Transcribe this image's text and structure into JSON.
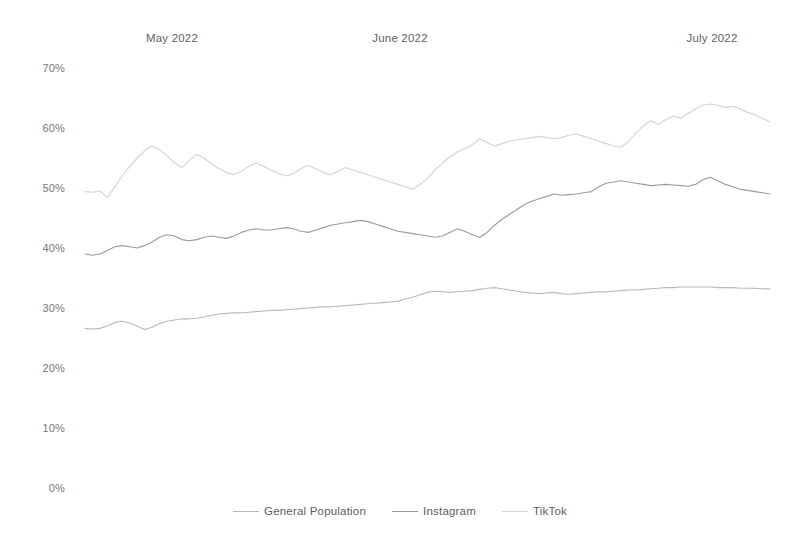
{
  "chart_data": {
    "type": "line",
    "title": "",
    "subtitle": "",
    "xlabel": "",
    "ylabel": "",
    "ylim": [
      0,
      70
    ],
    "ytick_labels": [
      "0%",
      "10%",
      "20%",
      "30%",
      "40%",
      "50%",
      "60%",
      "70%"
    ],
    "ytick_values": [
      0,
      10,
      20,
      30,
      40,
      50,
      60,
      70
    ],
    "xtick_labels": [
      "May 2022",
      "June 2022",
      "July 2022"
    ],
    "xtick_positions": [
      13,
      44,
      74
    ],
    "x_range": [
      0,
      92
    ],
    "grid": false,
    "legend_position": "bottom-center",
    "series": [
      {
        "name": "General Population",
        "color": "#b9b9b9",
        "values": [
          26.6,
          26.5,
          26.6,
          27.0,
          27.6,
          27.8,
          27.5,
          27.0,
          26.4,
          26.8,
          27.4,
          27.8,
          28.0,
          28.2,
          28.2,
          28.3,
          28.5,
          28.8,
          29.0,
          29.1,
          29.2,
          29.2,
          29.3,
          29.4,
          29.5,
          29.6,
          29.6,
          29.7,
          29.8,
          29.9,
          30.0,
          30.1,
          30.2,
          30.2,
          30.3,
          30.4,
          30.5,
          30.6,
          30.7,
          30.8,
          30.9,
          31.0,
          31.1,
          31.5,
          31.8,
          32.2,
          32.6,
          32.8,
          32.7,
          32.6,
          32.7,
          32.8,
          32.9,
          33.1,
          33.3,
          33.4,
          33.2,
          33.0,
          32.8,
          32.6,
          32.5,
          32.4,
          32.5,
          32.6,
          32.4,
          32.3,
          32.4,
          32.5,
          32.6,
          32.7,
          32.7,
          32.8,
          32.9,
          33.0,
          33.0,
          33.1,
          33.2,
          33.3,
          33.4,
          33.4,
          33.5,
          33.5,
          33.5,
          33.5,
          33.5,
          33.4,
          33.4,
          33.4,
          33.3,
          33.3,
          33.3,
          33.2,
          33.2
        ]
      },
      {
        "name": "Instagram",
        "color": "#9b9b9b",
        "values": [
          39.0,
          38.8,
          39.0,
          39.6,
          40.2,
          40.4,
          40.2,
          40.0,
          40.4,
          41.0,
          41.8,
          42.2,
          42.0,
          41.4,
          41.2,
          41.4,
          41.8,
          42.0,
          41.8,
          41.6,
          42.0,
          42.6,
          43.0,
          43.2,
          43.0,
          43.0,
          43.2,
          43.4,
          43.2,
          42.8,
          42.6,
          43.0,
          43.4,
          43.8,
          44.0,
          44.2,
          44.4,
          44.6,
          44.4,
          44.0,
          43.6,
          43.2,
          42.8,
          42.6,
          42.4,
          42.2,
          42.0,
          41.8,
          42.0,
          42.6,
          43.2,
          42.8,
          42.2,
          41.8,
          42.6,
          43.8,
          44.8,
          45.6,
          46.4,
          47.2,
          47.8,
          48.2,
          48.6,
          49.0,
          48.8,
          48.9,
          49.0,
          49.2,
          49.4,
          50.2,
          50.8,
          51.0,
          51.2,
          51.0,
          50.8,
          50.6,
          50.4,
          50.5,
          50.6,
          50.5,
          50.4,
          50.3,
          50.6,
          51.4,
          51.8,
          51.2,
          50.6,
          50.2,
          49.8,
          49.6,
          49.4,
          49.2,
          49.0
        ]
      },
      {
        "name": "TikTok",
        "color": "#d4d4d4",
        "values": [
          49.4,
          49.3,
          49.5,
          48.4,
          50.2,
          52.0,
          53.6,
          55.0,
          56.2,
          57.0,
          56.4,
          55.4,
          54.2,
          53.4,
          54.6,
          55.6,
          55.0,
          54.0,
          53.2,
          52.6,
          52.2,
          52.8,
          53.6,
          54.2,
          53.6,
          53.0,
          52.4,
          52.0,
          52.4,
          53.2,
          53.8,
          53.2,
          52.6,
          52.2,
          52.8,
          53.4,
          53.0,
          52.6,
          52.2,
          51.8,
          51.4,
          51.0,
          50.6,
          50.2,
          49.8,
          50.6,
          51.6,
          53.0,
          54.2,
          55.2,
          56.0,
          56.6,
          57.2,
          58.2,
          57.6,
          57.0,
          57.4,
          57.8,
          58.0,
          58.2,
          58.4,
          58.6,
          58.4,
          58.2,
          58.4,
          58.8,
          59.0,
          58.6,
          58.2,
          57.8,
          57.4,
          57.0,
          56.8,
          57.8,
          59.2,
          60.4,
          61.2,
          60.6,
          61.4,
          62.0,
          61.6,
          62.4,
          63.2,
          63.8,
          64.0,
          63.8,
          63.4,
          63.6,
          63.2,
          62.6,
          62.2,
          61.6,
          61.0
        ]
      }
    ],
    "legend": [
      {
        "label": "General Population",
        "color": "#b9b9b9"
      },
      {
        "label": "Instagram",
        "color": "#9b9b9b"
      },
      {
        "label": "TikTok",
        "color": "#d4d4d4"
      }
    ]
  }
}
